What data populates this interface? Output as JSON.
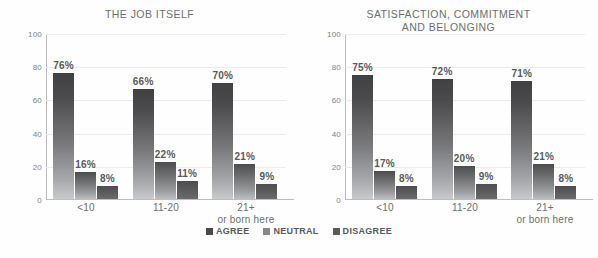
{
  "legend": {
    "items": [
      {
        "label": "AGREE",
        "color": "#4a4a4c"
      },
      {
        "label": "NEUTRAL",
        "color": "#88888b"
      },
      {
        "label": "DISAGREE",
        "color": "#5a5a5c"
      }
    ]
  },
  "chart_data": [
    {
      "type": "bar",
      "title": "THE JOB ITSELF",
      "xlabel": "",
      "ylabel": "",
      "ylim": [
        0,
        100
      ],
      "yticks": [
        0,
        20,
        40,
        60,
        80,
        100
      ],
      "grid": true,
      "legend_position": "bottom-center",
      "categories": [
        "<10",
        "11-20",
        "21+\nor born here"
      ],
      "series": [
        {
          "name": "AGREE",
          "values": [
            76,
            66,
            70
          ],
          "labels": [
            "76%",
            "66%",
            "70%"
          ]
        },
        {
          "name": "NEUTRAL",
          "values": [
            16,
            22,
            21
          ],
          "labels": [
            "16%",
            "22%",
            "21%"
          ]
        },
        {
          "name": "DISAGREE",
          "values": [
            8,
            11,
            9
          ],
          "labels": [
            "8%",
            "11%",
            "9%"
          ]
        }
      ]
    },
    {
      "type": "bar",
      "title": "SATISFACTION, COMMITMENT\nAND BELONGING",
      "xlabel": "",
      "ylabel": "",
      "ylim": [
        0,
        100
      ],
      "yticks": [
        0,
        20,
        40,
        60,
        80,
        100
      ],
      "grid": true,
      "legend_position": "bottom-center",
      "categories": [
        "<10",
        "11-20",
        "21+\nor born here"
      ],
      "series": [
        {
          "name": "AGREE",
          "values": [
            75,
            72,
            71
          ],
          "labels": [
            "75%",
            "72%",
            "71%"
          ]
        },
        {
          "name": "NEUTRAL",
          "values": [
            17,
            20,
            21
          ],
          "labels": [
            "17%",
            "20%",
            "21%"
          ]
        },
        {
          "name": "DISAGREE",
          "values": [
            8,
            9,
            8
          ],
          "labels": [
            "8%",
            "9%",
            "8%"
          ]
        }
      ]
    }
  ]
}
